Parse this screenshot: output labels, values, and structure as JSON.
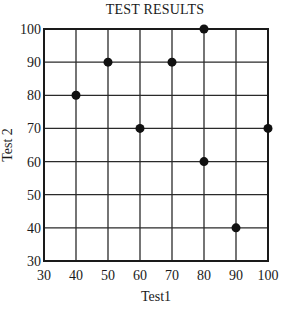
{
  "chart_data": {
    "type": "scatter",
    "title": "TEST RESULTS",
    "xlabel": "Test1",
    "ylabel": "Test 2",
    "xlim": [
      30,
      100
    ],
    "ylim": [
      30,
      100
    ],
    "xticks": [
      30,
      40,
      50,
      60,
      70,
      80,
      90,
      100
    ],
    "yticks": [
      30,
      40,
      50,
      60,
      70,
      80,
      90,
      100
    ],
    "grid": true,
    "legend": null,
    "points": [
      {
        "x": 40,
        "y": 80
      },
      {
        "x": 50,
        "y": 90
      },
      {
        "x": 60,
        "y": 70
      },
      {
        "x": 70,
        "y": 90
      },
      {
        "x": 80,
        "y": 100
      },
      {
        "x": 80,
        "y": 60
      },
      {
        "x": 90,
        "y": 40
      },
      {
        "x": 100,
        "y": 70
      }
    ],
    "marker_color": "#111111",
    "grid_color": "#2a2a2a"
  }
}
